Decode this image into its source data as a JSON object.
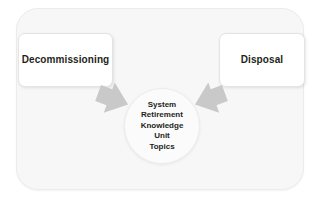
{
  "diagram": {
    "title": "System Retirement Knowledge Unit Topics",
    "outer_container": {
      "name": "system-retirement-boundary",
      "background_color": "#f7f7f7",
      "border_color": "#ececec"
    },
    "nodes": [
      {
        "id": "decommissioning",
        "label": "Decommissioning",
        "background_color": "#ffffff",
        "border_color": "#e4e4e4",
        "text_color": "#231f20"
      },
      {
        "id": "disposal",
        "label": "Disposal",
        "background_color": "#ffffff",
        "border_color": "#e4e4e4",
        "text_color": "#231f20"
      }
    ],
    "center": {
      "id": "system-retirement-knowledge-unit-topics",
      "lines": [
        "System",
        "Retirement",
        "Knowledge",
        "Unit",
        "Topics"
      ],
      "background_color": "#fbfbfb",
      "border_color": "#ededed",
      "text_color": "#231f20"
    },
    "arrows": [
      {
        "id": "arrow-decommissioning-to-center",
        "icon": "block-arrow-right-icon",
        "from": "decommissioning",
        "to": "system-retirement-knowledge-unit-topics",
        "color": "#c9c9c9"
      },
      {
        "id": "arrow-disposal-to-center",
        "icon": "block-arrow-left-icon",
        "from": "disposal",
        "to": "system-retirement-knowledge-unit-topics",
        "color": "#c9c9c9"
      }
    ]
  }
}
